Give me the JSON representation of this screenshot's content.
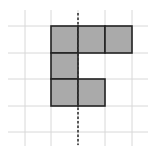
{
  "diagram": {
    "grid": {
      "vertical_lines_x": [
        25,
        51,
        78,
        105,
        132
      ],
      "horizontal_lines_y": [
        26,
        53,
        79,
        106,
        132
      ],
      "line_color": "#d8d8d8",
      "extent": {
        "x0": 8,
        "x1": 148,
        "y0": 10,
        "y1": 146
      }
    },
    "shaded_cells": [
      {
        "x": 51,
        "y": 26,
        "w": 27,
        "h": 27
      },
      {
        "x": 78,
        "y": 26,
        "w": 27,
        "h": 27
      },
      {
        "x": 105,
        "y": 26,
        "w": 27,
        "h": 27
      },
      {
        "x": 51,
        "y": 53,
        "w": 27,
        "h": 26
      },
      {
        "x": 51,
        "y": 79,
        "w": 27,
        "h": 27
      },
      {
        "x": 78,
        "y": 79,
        "w": 27,
        "h": 27
      }
    ],
    "fill_color": "#aaaaaa",
    "stroke_color": "#222222",
    "dashed_line": {
      "x": 78,
      "y1": 13,
      "y2": 145,
      "color": "#333333"
    }
  }
}
